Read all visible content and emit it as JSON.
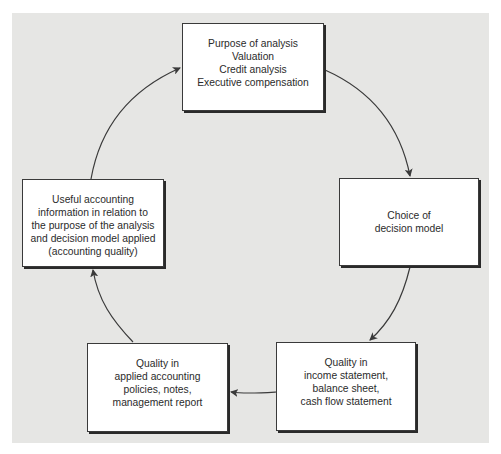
{
  "diagram": {
    "type": "cycle",
    "nodes": [
      {
        "id": "purpose",
        "lines": [
          "Purpose of analysis",
          "Valuation",
          "Credit analysis",
          "Executive compensation"
        ]
      },
      {
        "id": "decision_model",
        "lines": [
          "Choice of",
          "decision model"
        ]
      },
      {
        "id": "quality_statements",
        "lines": [
          "Quality in",
          "income statement,",
          "balance sheet,",
          "cash flow statement"
        ]
      },
      {
        "id": "quality_policies",
        "lines": [
          "Quality in",
          "applied accounting",
          "policies, notes,",
          "management report"
        ]
      },
      {
        "id": "useful_info",
        "lines": [
          "Useful accounting",
          "information in relation to",
          "the purpose of the analysis",
          "and decision model applied",
          "(accounting quality)"
        ]
      }
    ],
    "edges": [
      {
        "from": "purpose",
        "to": "decision_model"
      },
      {
        "from": "decision_model",
        "to": "quality_statements"
      },
      {
        "from": "quality_statements",
        "to": "quality_policies"
      },
      {
        "from": "quality_policies",
        "to": "useful_info"
      },
      {
        "from": "useful_info",
        "to": "purpose"
      }
    ],
    "colors": {
      "background": "#e6e6e4",
      "box_fill": "#ffffff",
      "box_border": "#3a3a3a",
      "arrow": "#3a3a3a",
      "text": "#2b2b2b"
    }
  }
}
